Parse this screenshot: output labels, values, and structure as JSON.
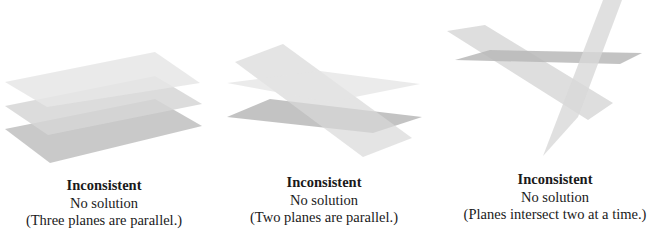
{
  "panels": [
    {
      "title": "Inconsistent",
      "subtitle": "No solution",
      "description": "(Three planes are parallel.)"
    },
    {
      "title": "Inconsistent",
      "subtitle": "No solution",
      "description": "(Two planes are parallel.)"
    },
    {
      "title": "Inconsistent",
      "subtitle": "No solution",
      "description": "(Planes intersect two at a time.)"
    }
  ],
  "colors": {
    "plane_light": "#e8e8e8",
    "plane_mid": "#d8d8d8",
    "plane_dark": "#c4c4c4",
    "text": "#1a1a1a"
  }
}
